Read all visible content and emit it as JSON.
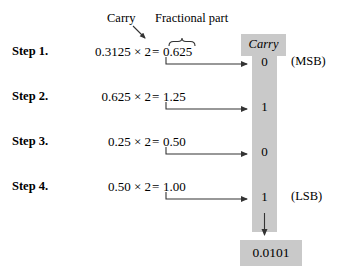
{
  "figure": {
    "annotations": {
      "carry_tag": "Carry",
      "fractional_tag": "Fractional part"
    },
    "carry_column": {
      "header": "Carry",
      "digits": [
        "0",
        "1",
        "0",
        "1"
      ]
    },
    "side_labels": {
      "msb": "(MSB)",
      "lsb": "(LSB)"
    },
    "result": {
      "value": "0.0101"
    },
    "steps": [
      {
        "label": "Step 1.",
        "operand": "0.3125",
        "times": "×",
        "multiplier": "2",
        "equals": "=",
        "integer_part": "0",
        "point": ".",
        "fraction_part": "625",
        "product": "0.625",
        "carry": "0"
      },
      {
        "label": "Step 2.",
        "operand": "0.625",
        "times": "×",
        "multiplier": "2",
        "equals": "=",
        "integer_part": "1",
        "point": ".",
        "fraction_part": "25",
        "product": "1.25",
        "carry": "1"
      },
      {
        "label": "Step 3.",
        "operand": "0.25",
        "times": "×",
        "multiplier": "2",
        "equals": "=",
        "integer_part": "0",
        "point": ".",
        "fraction_part": "50",
        "product": "0.50",
        "carry": "0"
      },
      {
        "label": "Step 4.",
        "operand": "0.50",
        "times": "×",
        "multiplier": "2",
        "equals": "=",
        "integer_part": "1",
        "point": ".",
        "fraction_part": "00",
        "product": "1.00",
        "carry": "1"
      }
    ],
    "colors": {
      "grey_fill": "#c9c9c9",
      "ink": "#111111",
      "page": "#ffffff"
    }
  }
}
